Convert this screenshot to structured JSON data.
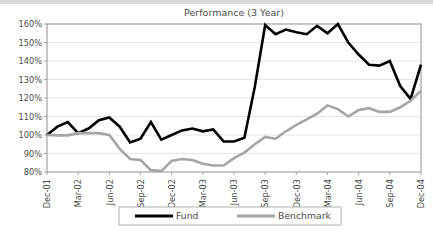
{
  "chart_data": {
    "type": "line",
    "title": "Performance (3 Year)",
    "xlabel": "",
    "ylabel": "",
    "ylim": [
      80,
      160
    ],
    "ytick_values": [
      80,
      90,
      100,
      110,
      120,
      130,
      140,
      150,
      160
    ],
    "ytick_labels": [
      "80%",
      "90%",
      "100%",
      "110%",
      "120%",
      "130%",
      "140%",
      "150%",
      "160%"
    ],
    "grid": true,
    "grid_axis": "y",
    "legend_position": "bottom",
    "x_tick_labels": [
      "Dec-01",
      "Mar-02",
      "Jun-02",
      "Sep-02",
      "Dec-02",
      "Mar-03",
      "Jun-03",
      "Sep-03",
      "Dec-03",
      "Mar-04",
      "Jun-04",
      "Sep-04",
      "Dec-04"
    ],
    "x_tick_indices": [
      0,
      3,
      6,
      9,
      12,
      15,
      18,
      21,
      24,
      27,
      30,
      33,
      36
    ],
    "x": [
      "Dec-01",
      "Jan-02",
      "Feb-02",
      "Mar-02",
      "Apr-02",
      "May-02",
      "Jun-02",
      "Jul-02",
      "Aug-02",
      "Sep-02",
      "Oct-02",
      "Nov-02",
      "Dec-02",
      "Jan-03",
      "Feb-03",
      "Mar-03",
      "Apr-03",
      "May-03",
      "Jun-03",
      "Jul-03",
      "Aug-03",
      "Sep-03",
      "Oct-03",
      "Nov-03",
      "Dec-03",
      "Jan-04",
      "Feb-04",
      "Mar-04",
      "Apr-04",
      "May-04",
      "Jun-04",
      "Jul-04",
      "Aug-04",
      "Sep-04",
      "Oct-04",
      "Nov-04",
      "Dec-04"
    ],
    "series": [
      {
        "name": "Fund",
        "color": "#000000",
        "width": 2.6,
        "values": [
          100.0,
          104.5,
          107.0,
          101.0,
          103.5,
          108.0,
          109.5,
          104.5,
          96.0,
          98.0,
          107.0,
          97.5,
          100.0,
          102.5,
          103.5,
          102.0,
          103.0,
          96.5,
          96.5,
          98.5,
          126.0,
          159.5,
          154.5,
          157.0,
          155.5,
          154.5,
          159.0,
          155.0,
          160.0,
          150.0,
          143.5,
          138.0,
          137.5,
          140.0,
          126.5,
          119.5,
          138.0
        ]
      },
      {
        "name": "Benchmark",
        "color": "#a6a6a6",
        "width": 2.6,
        "values": [
          100.0,
          99.8,
          99.8,
          101.0,
          101.0,
          101.0,
          100.0,
          92.5,
          87.0,
          86.5,
          81.0,
          80.5,
          86.0,
          87.0,
          86.5,
          84.5,
          83.5,
          83.5,
          87.5,
          90.5,
          95.0,
          99.0,
          98.0,
          102.0,
          105.5,
          108.5,
          111.5,
          116.0,
          114.0,
          110.0,
          113.5,
          114.5,
          112.5,
          112.5,
          115.0,
          118.5,
          124.0
        ]
      }
    ]
  },
  "legend": {
    "items": [
      {
        "label": "Fund",
        "color": "#000000"
      },
      {
        "label": "Benchmark",
        "color": "#a6a6a6"
      }
    ]
  }
}
